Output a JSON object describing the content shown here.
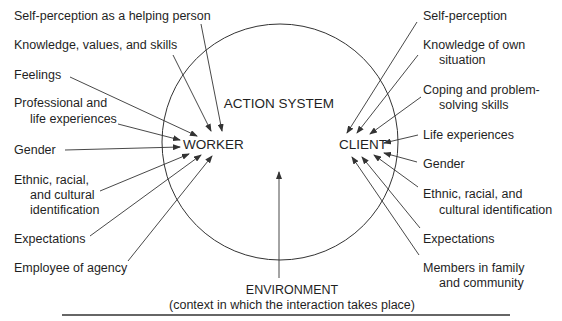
{
  "diagram": {
    "center_label": "ACTION SYSTEM",
    "worker": {
      "label": "WORKER",
      "influences": [
        {
          "lines": [
            "Self-perception as a helping person"
          ]
        },
        {
          "lines": [
            "Knowledge, values, and skills"
          ]
        },
        {
          "lines": [
            "Feelings"
          ]
        },
        {
          "lines": [
            "Professional and",
            "life experiences"
          ]
        },
        {
          "lines": [
            "Gender"
          ]
        },
        {
          "lines": [
            "Ethnic, racial,",
            "and cultural",
            "identification"
          ]
        },
        {
          "lines": [
            "Expectations"
          ]
        },
        {
          "lines": [
            "Employee of agency"
          ]
        }
      ]
    },
    "client": {
      "label": "CLIENT",
      "influences": [
        {
          "lines": [
            "Self-perception"
          ]
        },
        {
          "lines": [
            "Knowledge of own",
            "situation"
          ]
        },
        {
          "lines": [
            "Coping and problem-",
            "solving skills"
          ]
        },
        {
          "lines": [
            "Life experiences"
          ]
        },
        {
          "lines": [
            "Gender"
          ]
        },
        {
          "lines": [
            "Ethnic, racial, and",
            "cultural identification"
          ]
        },
        {
          "lines": [
            "Expectations"
          ]
        },
        {
          "lines": [
            "Members in family",
            "and community"
          ]
        }
      ]
    },
    "environment": {
      "label": "ENVIRONMENT",
      "sublabel": "(context in which the interaction takes place)"
    },
    "colors": {
      "line": "#333333",
      "text": "#1f1f1f",
      "background": "#ffffff"
    }
  }
}
